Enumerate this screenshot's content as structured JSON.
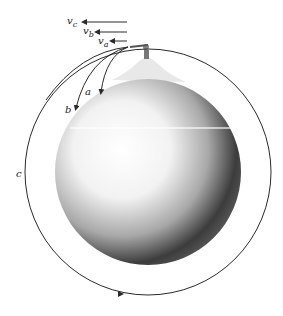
{
  "figure": {
    "velocities": [
      {
        "symbol": "v",
        "sub": "c",
        "label": "vc"
      },
      {
        "symbol": "v",
        "sub": "b",
        "label": "vb"
      },
      {
        "symbol": "v",
        "sub": "a",
        "label": "va"
      }
    ],
    "trajectories": [
      {
        "label": "a"
      },
      {
        "label": "b"
      },
      {
        "label": "c"
      }
    ],
    "colors": {
      "line": "#2a2a2a",
      "background": "#ffffff",
      "sphere_light": "#ffffff",
      "sphere_dark": "#2b2b2b"
    }
  }
}
